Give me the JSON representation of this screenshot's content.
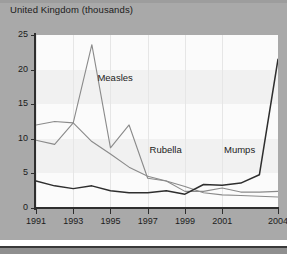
{
  "header": {
    "title": "United Kingdom (thousands)"
  },
  "chart_data": {
    "type": "line",
    "title": "United Kingdom (thousands)",
    "xlabel": "",
    "ylabel": "thousands",
    "xlim": [
      1991,
      2004
    ],
    "ylim": [
      0,
      25
    ],
    "grid": "faint vertical gridlines and alternating horizontal bands",
    "legend_position": "inline-annotations",
    "y_ticks": [
      "0",
      "5",
      "10",
      "15",
      "20",
      "25"
    ],
    "y_tick_values": [
      0,
      5,
      10,
      15,
      20,
      25
    ],
    "x_ticks": [
      "1991",
      "1993",
      "1995",
      "1997",
      "1999",
      "2001",
      "2004"
    ],
    "x_tick_values": [
      1991,
      1993,
      1995,
      1997,
      1999,
      2001,
      2004
    ],
    "x": [
      1991,
      1992,
      1993,
      1994,
      1995,
      1996,
      1997,
      1998,
      1999,
      2000,
      2001,
      2002,
      2003,
      2004
    ],
    "series": [
      {
        "name": "Measles",
        "color": "#8a8a8a",
        "values": [
          9.8,
          9.2,
          12.3,
          23.6,
          8.7,
          12.0,
          4.3,
          3.9,
          2.4,
          2.4,
          2.9,
          2.3,
          2.3,
          2.4
        ]
      },
      {
        "name": "Rubella",
        "color": "#8a8a8a",
        "values": [
          12.0,
          12.5,
          12.3,
          9.6,
          7.8,
          5.9,
          4.6,
          3.9,
          3.1,
          2.2,
          1.9,
          1.8,
          1.7,
          1.6
        ]
      },
      {
        "name": "Mumps",
        "color": "#2e2e2e",
        "values": [
          3.9,
          3.2,
          2.8,
          3.2,
          2.5,
          2.2,
          2.2,
          2.5,
          2.0,
          3.4,
          3.3,
          3.6,
          4.8,
          21.5
        ]
      }
    ],
    "annotations": [
      {
        "text": "Measles",
        "x": 1994.3,
        "y": 18.8
      },
      {
        "text": "Rubella",
        "x": 1997.1,
        "y": 8.4
      },
      {
        "text": "Mumps",
        "x": 2001.1,
        "y": 8.4
      }
    ]
  },
  "colors": {
    "panel": "#a9a9a9",
    "plot_background": "#fbfbfb",
    "band": "#f1f1f1",
    "axis": "#2e2e2e",
    "text": "#1b1b1b",
    "gridline": "#e6e6e6"
  }
}
